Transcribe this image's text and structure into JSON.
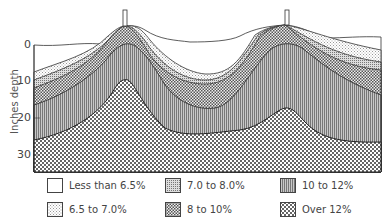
{
  "figure": {
    "type": "soil moisture cross-section",
    "y_axis_title": "Inches depth",
    "y_ticks": [
      "0",
      "10",
      "20",
      "30"
    ]
  },
  "legend": [
    {
      "label": "Less than 6.5%",
      "pattern": "blank"
    },
    {
      "label": "6.5 to 7.0%",
      "pattern": "fine-stipple"
    },
    {
      "label": "7.0 to 8.0%",
      "pattern": "fine-grid"
    },
    {
      "label": "8 to 10%",
      "pattern": "checker"
    },
    {
      "label": "10 to 12%",
      "pattern": "vertical-lines"
    },
    {
      "label": "Over 12%",
      "pattern": "coarse-dots"
    }
  ],
  "colors": {
    "line": "#333333",
    "paper": "#ffffff",
    "hatch": "#555555"
  }
}
